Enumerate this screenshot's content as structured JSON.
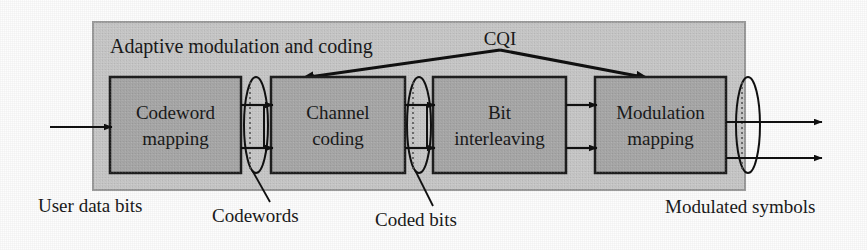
{
  "figure": {
    "type": "block-diagram",
    "title": "Adaptive modulation and coding",
    "background_color": "#fdfdfd",
    "container_fill": "#c9c9c9",
    "container_stroke": "#9a9a9a",
    "block_fill": "#a9a9a9",
    "block_stroke": "#1f1f1f",
    "line_color": "#111111"
  },
  "container": {
    "label": "Adaptive modulation and coding",
    "x": 93,
    "y": 22,
    "width": 652,
    "height": 168
  },
  "blocks": [
    {
      "id": "codeword-mapping",
      "line1": "Codeword",
      "line2": "mapping",
      "x": 110,
      "y": 77,
      "width": 131,
      "height": 96
    },
    {
      "id": "channel-coding",
      "line1": "Channel",
      "line2": "coding",
      "x": 271,
      "y": 77,
      "width": 134,
      "height": 96
    },
    {
      "id": "bit-interleaving",
      "line1": "Bit",
      "line2": "interleaving",
      "x": 433,
      "y": 77,
      "width": 133,
      "height": 96
    },
    {
      "id": "modulation-mapping",
      "line1": "Modulation",
      "line2": "mapping",
      "x": 595,
      "y": 77,
      "width": 131,
      "height": 96
    }
  ],
  "feedback": {
    "label": "CQI",
    "label_x": 500,
    "label_y": 45,
    "apex_x": 500,
    "apex_y": 50,
    "left_target_x": 300,
    "left_target_y": 79,
    "right_target_x": 650,
    "right_target_y": 79
  },
  "ellipses": [
    {
      "id": "codewords-ellipse",
      "cx": 256,
      "cy": 125,
      "rx": 12,
      "ry": 48
    },
    {
      "id": "coded-bits-ellipse",
      "cx": 419,
      "cy": 125,
      "rx": 12,
      "ry": 48
    },
    {
      "id": "symbols-ellipse",
      "cx": 739,
      "cy": 125,
      "rx": 12,
      "ry": 48
    }
  ],
  "external_labels": [
    {
      "id": "user-data-bits",
      "text": "User data bits",
      "x": 38,
      "y": 212,
      "anchor": "start"
    },
    {
      "id": "codewords",
      "text": "Codewords",
      "x": 212,
      "y": 221,
      "anchor": "start"
    },
    {
      "id": "coded-bits",
      "text": "Coded bits",
      "x": 375,
      "y": 225,
      "anchor": "start"
    },
    {
      "id": "modulated-symbols",
      "text": "Modulated symbols",
      "x": 665,
      "y": 212,
      "anchor": "start"
    }
  ],
  "connectors": {
    "input_arrow": {
      "x1": 50,
      "y1": 127,
      "x2": 110,
      "y2": 127
    },
    "output_arrow": {
      "x1": 726,
      "y1": 127,
      "x2": 820,
      "y2": 127
    },
    "between_1_2_top": {
      "x1": 241,
      "y1": 105,
      "x2": 271,
      "y2": 105
    },
    "between_1_2_bottom": {
      "x1": 241,
      "y1": 148,
      "x2": 271,
      "y2": 148
    },
    "between_2_3_top": {
      "x1": 405,
      "y1": 105,
      "x2": 433,
      "y2": 105
    },
    "between_2_3_bottom": {
      "x1": 405,
      "y1": 148,
      "x2": 433,
      "y2": 148
    },
    "between_3_4_top": {
      "x1": 566,
      "y1": 105,
      "x2": 595,
      "y2": 105
    },
    "between_3_4_bottom": {
      "x1": 566,
      "y1": 148,
      "x2": 595,
      "y2": 148
    },
    "leader_codewords": {
      "x1": 253,
      "y1": 172,
      "x2": 268,
      "y2": 200
    },
    "leader_coded_bits": {
      "x1": 416,
      "y1": 172,
      "x2": 432,
      "y2": 204
    },
    "output_arrow_lower": {
      "x1": 726,
      "y1": 160,
      "x2": 820,
      "y2": 160
    }
  }
}
